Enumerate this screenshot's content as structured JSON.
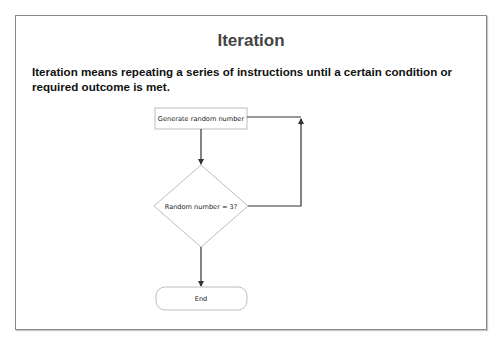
{
  "slide": {
    "title": "Iteration",
    "description": "Iteration means repeating a series of instructions until a certain condition or required outcome is met."
  },
  "flowchart": {
    "nodes": [
      {
        "id": "process",
        "type": "process",
        "label": "Generate random number"
      },
      {
        "id": "decision",
        "type": "decision",
        "label": "Random number = 3?"
      },
      {
        "id": "end",
        "type": "terminator",
        "label": "End"
      }
    ],
    "edges": [
      {
        "from": "process",
        "to": "decision",
        "label": ""
      },
      {
        "from": "decision",
        "to": "process",
        "label": "",
        "note": "loop back (no)"
      },
      {
        "from": "decision",
        "to": "end",
        "label": "",
        "note": "yes"
      }
    ],
    "colors": {
      "shape_border": "#b5b5b5",
      "connector": "#333333",
      "frame_border": "#8a8a8a",
      "title_text": "#444444",
      "body_text": "#111111"
    }
  }
}
